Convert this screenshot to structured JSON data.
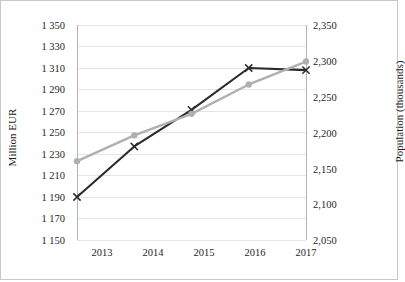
{
  "chart_data": {
    "type": "line",
    "title": "",
    "subtitle": "",
    "xlabel": "",
    "categories": [
      "2013",
      "2014",
      "2015",
      "2016",
      "2017"
    ],
    "grid": "horizontal",
    "legend": "none",
    "annotations": [],
    "axes": {
      "left": {
        "label": "Million EUR",
        "ticks": [
          "1 150",
          "1 170",
          "1 190",
          "1 210",
          "1 230",
          "1 250",
          "1 270",
          "1 290",
          "1 310",
          "1 330",
          "1 350"
        ],
        "min": 1150,
        "max": 1350,
        "step": 20
      },
      "right": {
        "label": "Population (thousands)",
        "ticks": [
          "2,050",
          "2,100",
          "2,150",
          "2,200",
          "2,250",
          "2,300",
          "2,350"
        ],
        "min": 2050,
        "max": 2350,
        "step": 50
      }
    },
    "series": [
      {
        "name": "Million EUR",
        "axis": "left",
        "color": "#2b2b2b",
        "marker": "x",
        "values": [
          1190,
          1237,
          1271,
          1310,
          1308
        ]
      },
      {
        "name": "Population (thousands)",
        "axis": "right",
        "color": "#b0b0b0",
        "marker": "circle",
        "values": [
          2160,
          2196,
          2226,
          2267,
          2299
        ]
      }
    ]
  }
}
